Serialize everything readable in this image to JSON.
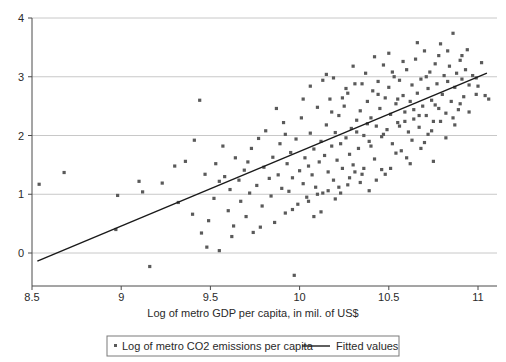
{
  "chart_data": {
    "type": "scatter",
    "title": "",
    "xlabel": "Log of metro GDP per capita, in mil. of US$",
    "ylabel": "",
    "xlim": [
      8.45,
      11.15
    ],
    "ylim": [
      -0.55,
      4.2
    ],
    "xticks": [
      8.5,
      9,
      9.5,
      10,
      10.5,
      11
    ],
    "xticklabels": [
      "8.5",
      "9",
      "9.5",
      "10",
      "10.5",
      "11"
    ],
    "yticks": [
      0,
      1,
      2,
      3,
      4
    ],
    "yticklabels": [
      "0",
      "1",
      "2",
      "3",
      "4"
    ],
    "grid": "horizontal",
    "legend_position": "below-axis",
    "marker_color": "#5a5a5a",
    "line_color": "#1a1a1a",
    "grid_color": "#c8c8c8",
    "axis_color": "#4a4a4a",
    "series": [
      {
        "name": "Log of metro CO2 emissions per capita",
        "type": "scatter",
        "marker": "small-filled-square",
        "points": [
          [
            8.54,
            1.17
          ],
          [
            8.68,
            1.37
          ],
          [
            8.98,
            0.98
          ],
          [
            8.97,
            0.4
          ],
          [
            9.1,
            1.22
          ],
          [
            9.12,
            1.04
          ],
          [
            9.16,
            -0.23
          ],
          [
            9.23,
            1.19
          ],
          [
            9.32,
            0.86
          ],
          [
            9.36,
            1.56
          ],
          [
            9.4,
            0.66
          ],
          [
            9.44,
            2.6
          ],
          [
            9.45,
            0.34
          ],
          [
            9.47,
            1.34
          ],
          [
            9.48,
            0.1
          ],
          [
            9.49,
            0.55
          ],
          [
            9.52,
            0.93
          ],
          [
            9.53,
            1.52
          ],
          [
            9.55,
            0.04
          ],
          [
            9.57,
            1.82
          ],
          [
            9.58,
            1.3
          ],
          [
            9.6,
            0.72
          ],
          [
            9.61,
            1.08
          ],
          [
            9.63,
            0.46
          ],
          [
            9.64,
            1.62
          ],
          [
            9.66,
            1.24
          ],
          [
            9.67,
            0.88
          ],
          [
            9.69,
            1.41
          ],
          [
            9.7,
            0.62
          ],
          [
            9.72,
            1.02
          ],
          [
            9.73,
            1.78
          ],
          [
            9.74,
            0.35
          ],
          [
            9.76,
            1.15
          ],
          [
            9.77,
            1.95
          ],
          [
            9.79,
            0.8
          ],
          [
            9.8,
            1.46
          ],
          [
            9.81,
            2.08
          ],
          [
            9.83,
            1.27
          ],
          [
            9.84,
            0.97
          ],
          [
            9.85,
            1.63
          ],
          [
            9.86,
            0.52
          ],
          [
            9.88,
            1.33
          ],
          [
            9.89,
            1.86
          ],
          [
            9.9,
            1.1
          ],
          [
            9.91,
            2.22
          ],
          [
            9.92,
            0.68
          ],
          [
            9.93,
            1.52
          ],
          [
            9.94,
            1.05
          ],
          [
            9.95,
            1.71
          ],
          [
            9.96,
            1.28
          ],
          [
            9.97,
            -0.38
          ],
          [
            9.98,
            1.94
          ],
          [
            9.99,
            0.83
          ],
          [
            10.0,
            1.4
          ],
          [
            10.01,
            2.3
          ],
          [
            10.02,
            1.18
          ],
          [
            10.03,
            1.62
          ],
          [
            10.04,
            0.95
          ],
          [
            10.05,
            1.48
          ],
          [
            10.06,
            2.04
          ],
          [
            10.07,
            1.33
          ],
          [
            10.08,
            1.77
          ],
          [
            10.09,
            1.12
          ],
          [
            10.1,
            2.48
          ],
          [
            10.11,
            1.55
          ],
          [
            10.12,
            1.9
          ],
          [
            10.13,
            1.02
          ],
          [
            10.14,
            1.66
          ],
          [
            10.15,
            2.18
          ],
          [
            10.16,
            1.38
          ],
          [
            10.17,
            2.62
          ],
          [
            10.18,
            1.82
          ],
          [
            10.19,
            1.24
          ],
          [
            10.2,
            2.05
          ],
          [
            10.21,
            1.58
          ],
          [
            10.22,
            2.34
          ],
          [
            10.23,
            1.86
          ],
          [
            10.24,
            1.44
          ],
          [
            10.25,
            2.5
          ],
          [
            10.26,
            1.96
          ],
          [
            10.27,
            2.72
          ],
          [
            10.28,
            1.68
          ],
          [
            10.29,
            2.12
          ],
          [
            10.3,
            1.5
          ],
          [
            10.31,
            2.88
          ],
          [
            10.32,
            2.26
          ],
          [
            10.33,
            1.78
          ],
          [
            10.34,
            2.42
          ],
          [
            10.35,
            1.34
          ],
          [
            10.36,
            2.0
          ],
          [
            10.37,
            3.06
          ],
          [
            10.38,
            2.58
          ],
          [
            10.39,
            1.9
          ],
          [
            10.4,
            2.3
          ],
          [
            10.41,
            2.76
          ],
          [
            10.42,
            1.6
          ],
          [
            10.43,
            2.16
          ],
          [
            10.44,
            2.92
          ],
          [
            10.45,
            2.46
          ],
          [
            10.46,
            1.98
          ],
          [
            10.47,
            3.2
          ],
          [
            10.48,
            2.64
          ],
          [
            10.49,
            2.1
          ],
          [
            10.5,
            2.82
          ],
          [
            10.51,
            2.36
          ],
          [
            10.52,
            1.86
          ],
          [
            10.53,
            3.0
          ],
          [
            10.54,
            2.54
          ],
          [
            10.55,
            2.22
          ],
          [
            10.56,
            2.94
          ],
          [
            10.57,
            1.74
          ],
          [
            10.58,
            2.68
          ],
          [
            10.59,
            2.4
          ],
          [
            10.6,
            3.12
          ],
          [
            10.61,
            2.06
          ],
          [
            10.62,
            2.58
          ],
          [
            10.63,
            2.86
          ],
          [
            10.64,
            2.28
          ],
          [
            10.65,
            3.3
          ],
          [
            10.66,
            2.72
          ],
          [
            10.67,
            2.14
          ],
          [
            10.68,
            2.96
          ],
          [
            10.69,
            2.5
          ],
          [
            10.7,
            3.44
          ],
          [
            10.71,
            2.34
          ],
          [
            10.72,
            2.8
          ],
          [
            10.73,
            3.08
          ],
          [
            10.74,
            2.6
          ],
          [
            10.75,
            2.24
          ],
          [
            10.76,
            3.22
          ],
          [
            10.77,
            2.88
          ],
          [
            10.78,
            2.46
          ],
          [
            10.79,
            3.56
          ],
          [
            10.8,
            2.7
          ],
          [
            10.81,
            3.02
          ],
          [
            10.82,
            2.38
          ],
          [
            10.83,
            2.92
          ],
          [
            10.84,
            3.18
          ],
          [
            10.85,
            2.58
          ],
          [
            10.86,
            3.74
          ],
          [
            10.87,
            2.82
          ],
          [
            10.88,
            3.06
          ],
          [
            10.89,
            2.44
          ],
          [
            10.9,
            3.28
          ],
          [
            10.91,
            2.96
          ],
          [
            10.92,
            2.66
          ],
          [
            10.93,
            3.12
          ],
          [
            10.95,
            2.86
          ],
          [
            10.97,
            3.02
          ],
          [
            10.99,
            2.7
          ],
          [
            11.02,
            3.24
          ],
          [
            11.04,
            2.68
          ],
          [
            9.3,
            1.48
          ],
          [
            9.41,
            1.92
          ],
          [
            9.55,
            1.22
          ],
          [
            9.62,
            0.28
          ],
          [
            9.71,
            1.55
          ],
          [
            9.78,
            0.44
          ],
          [
            9.87,
            2.46
          ],
          [
            9.96,
            0.74
          ],
          [
            10.05,
            0.88
          ],
          [
            10.1,
            1.0
          ],
          [
            10.13,
            2.94
          ],
          [
            10.18,
            2.4
          ],
          [
            10.22,
            1.12
          ],
          [
            10.26,
            2.8
          ],
          [
            10.3,
            3.18
          ],
          [
            10.34,
            1.2
          ],
          [
            10.38,
            2.2
          ],
          [
            10.42,
            3.34
          ],
          [
            10.46,
            1.42
          ],
          [
            10.5,
            3.4
          ],
          [
            10.54,
            1.7
          ],
          [
            10.58,
            3.26
          ],
          [
            10.62,
            1.52
          ],
          [
            10.66,
            3.58
          ],
          [
            10.7,
            1.88
          ],
          [
            10.74,
            2.08
          ],
          [
            10.78,
            3.36
          ],
          [
            10.82,
            1.96
          ],
          [
            10.86,
            2.3
          ],
          [
            10.9,
            2.54
          ],
          [
            10.94,
            3.46
          ],
          [
            11.06,
            2.62
          ],
          [
            10.16,
            1.06
          ],
          [
            10.2,
            0.92
          ],
          [
            10.24,
            2.64
          ],
          [
            10.28,
            1.28
          ],
          [
            10.32,
            2.06
          ],
          [
            10.36,
            1.44
          ],
          [
            10.4,
            1.82
          ],
          [
            10.44,
            2.7
          ],
          [
            10.48,
            1.34
          ],
          [
            10.52,
            3.08
          ],
          [
            10.56,
            2.16
          ],
          [
            10.6,
            1.62
          ],
          [
            10.64,
            2.44
          ],
          [
            10.68,
            1.78
          ],
          [
            10.72,
            2.02
          ],
          [
            10.76,
            2.52
          ],
          [
            9.92,
            2.02
          ],
          [
            10.02,
            2.62
          ],
          [
            10.06,
            2.84
          ],
          [
            10.08,
            0.62
          ],
          [
            10.12,
            0.7
          ],
          [
            10.15,
            3.04
          ],
          [
            10.19,
            2.98
          ],
          [
            10.23,
            1.02
          ],
          [
            10.27,
            1.16
          ],
          [
            10.31,
            1.38
          ],
          [
            10.35,
            2.88
          ],
          [
            10.39,
            1.06
          ],
          [
            10.43,
            1.24
          ],
          [
            10.47,
            2.02
          ],
          [
            10.51,
            1.44
          ],
          [
            10.55,
            2.62
          ],
          [
            10.59,
            2.24
          ],
          [
            10.63,
            1.92
          ],
          [
            10.67,
            2.34
          ],
          [
            10.71,
            3.0
          ],
          [
            10.75,
            1.56
          ],
          [
            10.79,
            2.24
          ],
          [
            10.83,
            3.44
          ],
          [
            10.87,
            2.18
          ],
          [
            10.91,
            3.36
          ],
          [
            10.95,
            2.4
          ],
          [
            10.99,
            2.98
          ],
          [
            11.0,
            2.84
          ]
        ]
      },
      {
        "name": "Fitted values",
        "type": "line",
        "endpoints": [
          [
            8.53,
            -0.14
          ],
          [
            11.05,
            3.06
          ]
        ],
        "slope": 1.27,
        "intercept": -10.97
      }
    ],
    "legend": [
      {
        "label": "Log of metro CO2 emissions per capita",
        "marker": "point"
      },
      {
        "label": "Fitted values",
        "marker": "line"
      }
    ]
  }
}
